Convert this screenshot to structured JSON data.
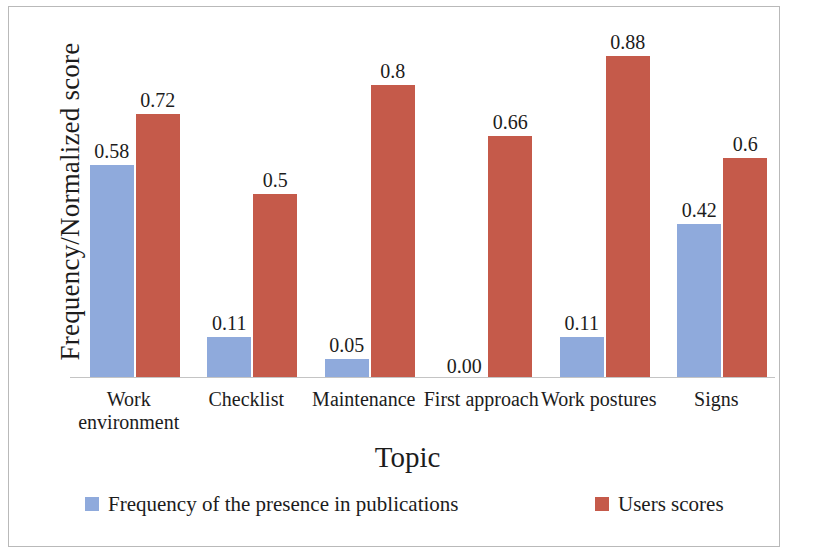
{
  "chart_data": {
    "type": "bar",
    "title": "",
    "xlabel": "Topic",
    "ylabel": "Frequency/Normalized score",
    "categories": [
      "Work environment",
      "Checklist",
      "Maintenance",
      "First approach",
      "Work postures",
      "Signs"
    ],
    "category_lines": [
      [
        "Work",
        "environment"
      ],
      [
        "Checklist"
      ],
      [
        "Maintenance"
      ],
      [
        "First approach"
      ],
      [
        "Work postures"
      ],
      [
        "Signs"
      ]
    ],
    "series": [
      {
        "name": "Frequency of the presence in publications",
        "color": "#8FAADC",
        "values": [
          0.58,
          0.11,
          0.05,
          0.0,
          0.11,
          0.42
        ],
        "labels": [
          "0.58",
          "0.11",
          "0.05",
          "0.00",
          "0.11",
          "0.42"
        ]
      },
      {
        "name": "Users scores",
        "color": "#C55A4A",
        "values": [
          0.72,
          0.5,
          0.8,
          0.66,
          0.88,
          0.6
        ],
        "labels": [
          "0.72",
          "0.5",
          "0.8",
          "0.66",
          "0.88",
          "0.6"
        ]
      }
    ],
    "ylim": [
      0,
      0.98
    ],
    "grid": false,
    "legend_position": "bottom",
    "axis_color": "#c4c4c4"
  },
  "legend": {
    "entries": [
      {
        "label": "Frequency of the presence in publications",
        "color": "#8FAADC"
      },
      {
        "label": "Users scores",
        "color": "#C55A4A"
      }
    ]
  }
}
